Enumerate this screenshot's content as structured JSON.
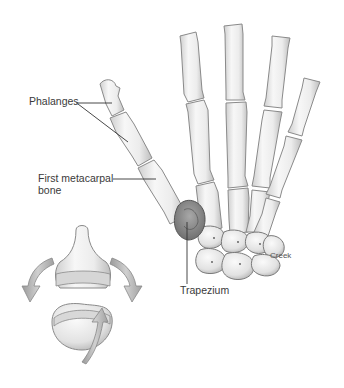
{
  "figure": {
    "labels": {
      "phalanges": "Phalanges",
      "first_metacarpal_line1": "First metacarpal",
      "first_metacarpal_line2": "bone",
      "trapezium": "Trapezium",
      "credit": "Creek"
    },
    "inset": {
      "description": "Saddle joint diagram with rotation arrows"
    },
    "colors": {
      "bone_fill": "#efefef",
      "bone_stroke": "#8a8a8a",
      "bone_shadow": "#c8c8c8",
      "trapezium_fill": "#8c8c8c",
      "label_text": "#3a3a3a",
      "leader_line": "#333333",
      "arrow_fill": "#b5b5b5"
    }
  }
}
